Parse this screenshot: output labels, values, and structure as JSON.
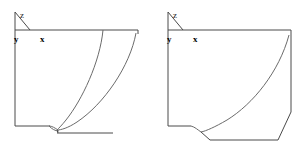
{
  "figure": {
    "panel_count": 2,
    "background_color": "#ffffff",
    "line_color": "#4a4a4a",
    "curve_color": "#6b6b6b"
  },
  "panels": [
    {
      "id": "left",
      "name": "left-figure",
      "axes": {
        "z_label": "z",
        "y_label": "y",
        "x_label": "x",
        "origin": {
          "x": 15,
          "y": 30
        },
        "z_axis_end": {
          "x": 15,
          "y": 12
        },
        "x_axis_end": {
          "x": 138,
          "y": 30
        },
        "y_axis_end": {
          "x": 28,
          "y": 18
        }
      },
      "outline": {
        "top_edge": "15,30 138,30",
        "left_edge": "15,30 15,126",
        "bottom_edge": "15,126 50,126",
        "right_edge": "138,30 138,33",
        "lower_rail": "57,133 113,133"
      },
      "curves": [
        {
          "name": "inner-profile-curve",
          "start": {
            "x": 103,
            "y": 30
          },
          "end": {
            "x": 57,
            "y": 130
          },
          "note": "concave curve sweeping left and down to the convergence node"
        },
        {
          "name": "outer-profile-curve",
          "start": {
            "x": 136,
            "y": 32
          },
          "end": {
            "x": 57,
            "y": 130
          },
          "note": "outer concave curve meeting the same convergence node"
        },
        {
          "name": "cusp-arc",
          "start": {
            "x": 50,
            "y": 126
          },
          "end": {
            "x": 60,
            "y": 131
          },
          "note": "small lens/cusp detail at the base junction"
        }
      ]
    },
    {
      "id": "right",
      "name": "right-figure",
      "axes": {
        "z_label": "z",
        "y_label": "y",
        "x_label": "x",
        "origin": {
          "x": 15,
          "y": 30
        },
        "z_axis_end": {
          "x": 15,
          "y": 12
        },
        "x_axis_end": {
          "x": 138,
          "y": 30
        },
        "y_axis_end": {
          "x": 28,
          "y": 18
        }
      },
      "outline": {
        "top_edge": "15,30 138,30",
        "left_edge": "15,30 15,126",
        "bottom_edge": "15,126 38,126",
        "right_edge": "138,30 138,34",
        "lower_rail": "57,140 125,140",
        "right_riser": "125,140 138,112"
      },
      "curves": [
        {
          "name": "inner-profile-curve",
          "start": {
            "x": 136,
            "y": 34
          },
          "end": {
            "x": 48,
            "y": 132
          },
          "note": "long sweeping concave curve down to the lower-left shoulder"
        },
        {
          "name": "shoulder-step",
          "start": {
            "x": 38,
            "y": 126
          },
          "end": {
            "x": 48,
            "y": 132
          },
          "note": "short step connecting bottom edge to the curve foot"
        },
        {
          "name": "base-leg",
          "start": {
            "x": 48,
            "y": 132
          },
          "end": {
            "x": 57,
            "y": 140
          },
          "note": "angled leg descending to the lower rail"
        }
      ]
    }
  ]
}
